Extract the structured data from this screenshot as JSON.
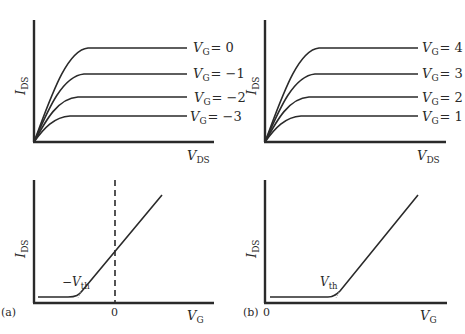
{
  "figure": {
    "panel_a_label": "(a)",
    "panel_b_label": "(b)",
    "top_left": {
      "y_axis": {
        "symbol": "I",
        "subscript": "DS"
      },
      "x_axis": {
        "symbol": "V",
        "subscript": "DS"
      },
      "curves": [
        {
          "symbol": "V",
          "subscript": "G",
          "value": "= 0"
        },
        {
          "symbol": "V",
          "subscript": "G",
          "value": "= −1"
        },
        {
          "symbol": "V",
          "subscript": "G",
          "value": "= −2"
        },
        {
          "symbol": "V",
          "subscript": "G",
          "value": "= −3"
        }
      ]
    },
    "top_right": {
      "y_axis": {
        "symbol": "I",
        "subscript": "DS"
      },
      "x_axis": {
        "symbol": "V",
        "subscript": "DS"
      },
      "curves": [
        {
          "symbol": "V",
          "subscript": "G",
          "value": "= 4"
        },
        {
          "symbol": "V",
          "subscript": "G",
          "value": "= 3"
        },
        {
          "symbol": "V",
          "subscript": "G",
          "value": "= 2"
        },
        {
          "symbol": "V",
          "subscript": "G",
          "value": "= 1"
        }
      ]
    },
    "bottom_left": {
      "y_axis": {
        "symbol": "I",
        "subscript": "DS"
      },
      "x_axis": {
        "symbol": "V",
        "subscript": "G"
      },
      "zero_tick": "0",
      "threshold": {
        "prefix": "−",
        "symbol": "V",
        "subscript": "th"
      }
    },
    "bottom_right": {
      "y_axis": {
        "symbol": "I",
        "subscript": "DS"
      },
      "x_axis": {
        "symbol": "V",
        "subscript": "G"
      },
      "zero_tick": "0",
      "threshold": {
        "prefix": "",
        "symbol": "V",
        "subscript": "th"
      }
    }
  }
}
